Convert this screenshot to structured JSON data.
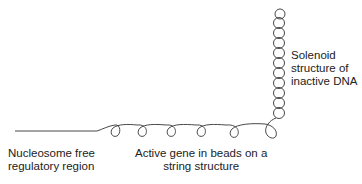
{
  "labels": {
    "solenoid": {
      "line1": "Solenoid",
      "line2": "structure of",
      "line3": "inactive DNA"
    },
    "nucleosome_free": {
      "line1": "Nucleosome free",
      "line2": "regulatory region"
    },
    "active_gene": {
      "line1": "Active gene in beads on a",
      "line2": "string structure"
    }
  },
  "diagram": {
    "stroke_color": "#333333",
    "bead_loops": 5,
    "solenoid_loops": 11
  }
}
